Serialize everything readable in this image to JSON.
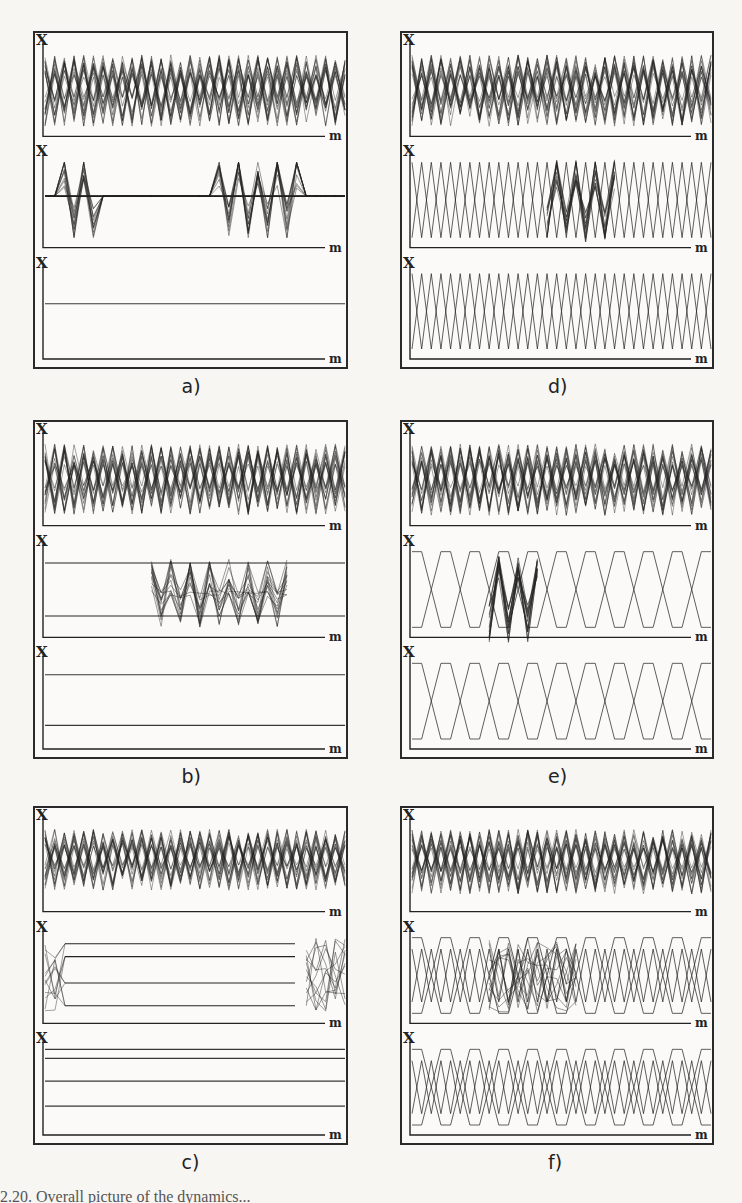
{
  "figure": {
    "axis_labels": {
      "y": "X",
      "x": "m"
    },
    "panels": [
      {
        "id": "a",
        "label": "a)",
        "x": 33,
        "y": 31,
        "w": 315,
        "h": 338,
        "rows": [
          {
            "type": "chaos",
            "seed": 1,
            "amp": 1.0
          },
          {
            "type": "localized",
            "clusters": [
              [
                0.05,
                0.17
              ],
              [
                0.55,
                0.85
              ]
            ],
            "base": 0.45
          },
          {
            "type": "flat",
            "lines": [
              0.4
            ]
          }
        ]
      },
      {
        "id": "b",
        "label": "b)",
        "x": 33,
        "y": 420,
        "w": 315,
        "h": 339,
        "rows": [
          {
            "type": "chaos",
            "seed": 2,
            "amp": 1.0
          },
          {
            "type": "front",
            "cluster": [
              0.35,
              0.82
            ],
            "lines": [
              0.15,
              0.85
            ]
          },
          {
            "type": "flat",
            "lines": [
              0.15,
              0.82
            ]
          }
        ]
      },
      {
        "id": "c",
        "label": "c)",
        "x": 33,
        "y": 806,
        "w": 315,
        "h": 339,
        "rows": [
          {
            "type": "chaos",
            "seed": 3,
            "amp": 0.85
          },
          {
            "type": "cross",
            "cluster": [
              0.85,
              1.0
            ],
            "lines": [
              0.08,
              0.25,
              0.6,
              0.9
            ]
          },
          {
            "type": "flat",
            "lines": [
              0.0,
              0.12,
              0.42,
              0.75
            ]
          }
        ]
      },
      {
        "id": "d",
        "label": "d)",
        "x": 400,
        "y": 31,
        "w": 314,
        "h": 338,
        "rows": [
          {
            "type": "chaos",
            "seed": 4,
            "amp": 1.0
          },
          {
            "type": "zigzag-defect",
            "period": 2,
            "cluster": [
              0.43,
              0.7
            ]
          },
          {
            "type": "zigzag",
            "period": 2
          }
        ]
      },
      {
        "id": "e",
        "label": "e)",
        "x": 400,
        "y": 420,
        "w": 314,
        "h": 339,
        "rows": [
          {
            "type": "chaos",
            "seed": 5,
            "amp": 1.0
          },
          {
            "type": "hex-defect",
            "cluster": [
              0.25,
              0.45
            ]
          },
          {
            "type": "hex"
          }
        ]
      },
      {
        "id": "f",
        "label": "f)",
        "x": 400,
        "y": 806,
        "w": 314,
        "h": 339,
        "rows": [
          {
            "type": "chaos",
            "seed": 6,
            "amp": 0.9
          },
          {
            "type": "mixed-defect",
            "cluster": [
              0.25,
              0.58
            ]
          },
          {
            "type": "mixed"
          }
        ]
      }
    ]
  },
  "caption_partial": "2.20. Overall picture of the dynamics..."
}
